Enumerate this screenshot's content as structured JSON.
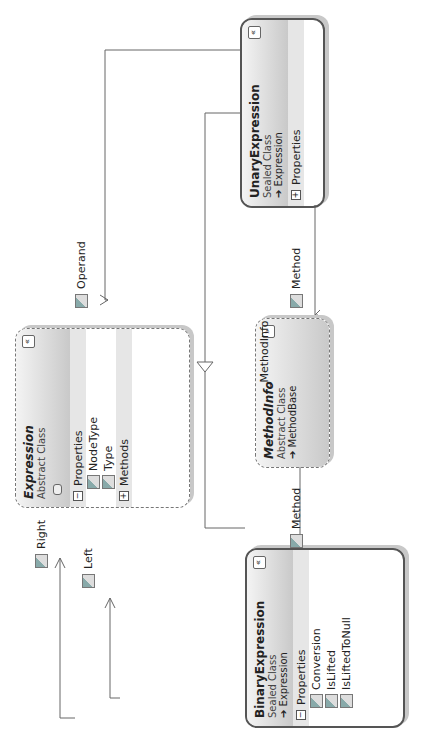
{
  "classes": {
    "expression": {
      "name": "Expression",
      "kind": "Abstract Class",
      "sections": {
        "properties": "Properties",
        "methods": "Methods"
      },
      "properties": [
        "NodeType",
        "Type"
      ]
    },
    "unary": {
      "name": "UnaryExpression",
      "kind": "Sealed Class",
      "base": "Expression",
      "sections": {
        "properties": "Properties"
      }
    },
    "binary": {
      "name": "BinaryExpression",
      "kind": "Sealed Class",
      "base": "Expression",
      "sections": {
        "properties": "Properties"
      },
      "properties": [
        "Conversion",
        "IsLifted",
        "IsLiftedToNull"
      ]
    },
    "methodinfo": {
      "name": "MethodInfo",
      "kind": "Abstract Class",
      "base": "MethodBase"
    }
  },
  "associations": {
    "operand": "Operand",
    "method_unary": "Method",
    "method_binary": "Method",
    "left": "Left",
    "right": "Right",
    "interface": "_MethodInfo"
  },
  "icons": {
    "collapse": "«",
    "expand": "»",
    "minus": "−",
    "plus": "+",
    "inherit_arrow": "➔"
  }
}
